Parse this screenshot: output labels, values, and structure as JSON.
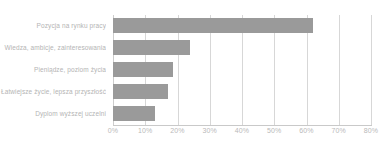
{
  "chart_data": {
    "type": "bar",
    "orientation": "horizontal",
    "title": "",
    "xlabel": "",
    "ylabel": "",
    "categories": [
      "Pozycja na rynku pracy",
      "Wiedza, ambicje, zainteresowania",
      "Pieniądze, poziom życia",
      "Łatwiejsze życie, lepsza przyszłość",
      "Dyplom wyższej uczelni"
    ],
    "values": [
      62,
      24,
      18.5,
      17,
      13
    ],
    "xlim": [
      0,
      80
    ],
    "xticks": [
      0,
      10,
      20,
      30,
      40,
      50,
      60,
      70,
      80
    ],
    "xtick_labels": [
      "0%",
      "10%",
      "20%",
      "30%",
      "40%",
      "50%",
      "60%",
      "70%",
      "80%"
    ],
    "grid": true,
    "grid_axis": "x",
    "legend": false,
    "bar_color": "#9a9a9a",
    "gridline_color": "#d7d7d7",
    "label_color": "#b4b4b4",
    "tick_color": "#b9b9b9",
    "background": "#ffffff"
  }
}
